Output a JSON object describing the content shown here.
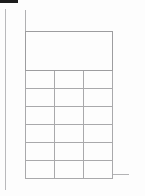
{
  "document": {
    "type": "blank-table-form",
    "orientation": "portrait",
    "background_color": "#fdfdfd",
    "rule_color": "#b0b0b2",
    "grid_color": "#a9a9ab",
    "artifact_color": "#1c1c1c"
  },
  "artifacts": {
    "scan_mark_label": "",
    "margin_rule_label": "",
    "baseline_label": ""
  },
  "table": {
    "caption": "",
    "header": {
      "cells": [
        ""
      ]
    },
    "columns": [
      {
        "key": "col_a",
        "label": ""
      },
      {
        "key": "col_b",
        "label": ""
      },
      {
        "key": "col_c",
        "label": ""
      }
    ],
    "rows": [
      {
        "cells": [
          "",
          "",
          ""
        ]
      },
      {
        "cells": [
          "",
          "",
          ""
        ]
      },
      {
        "cells": [
          "",
          "",
          ""
        ]
      },
      {
        "cells": [
          "",
          "",
          ""
        ]
      },
      {
        "cells": [
          "",
          "",
          ""
        ]
      },
      {
        "cells": [
          "",
          "",
          ""
        ]
      }
    ]
  }
}
